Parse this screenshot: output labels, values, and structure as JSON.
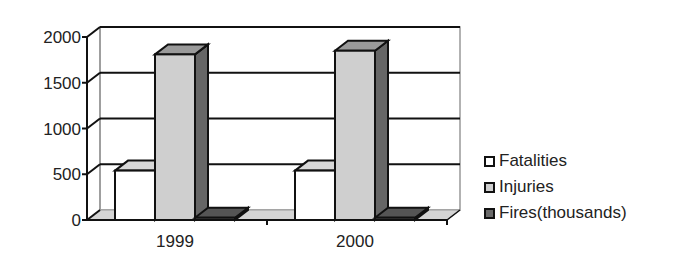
{
  "chart_data": {
    "type": "bar",
    "style": "3d-clustered-column",
    "title": "",
    "xlabel": "",
    "ylabel": "",
    "categories": [
      "1999",
      "2000"
    ],
    "series": [
      {
        "name": "Fatalities",
        "values": [
          540,
          540
        ],
        "color": "#ffffff"
      },
      {
        "name": "Injuries",
        "values": [
          1810,
          1850
        ],
        "color": "#cfcfcf"
      },
      {
        "name": "Fires(thousands)",
        "values": [
          25,
          25
        ],
        "color": "#6a6a6a"
      }
    ],
    "ylim": [
      0,
      2000
    ],
    "yticks": [
      "0",
      "500",
      "1000",
      "1500",
      "2000"
    ],
    "grid": true,
    "legend_position": "right"
  }
}
